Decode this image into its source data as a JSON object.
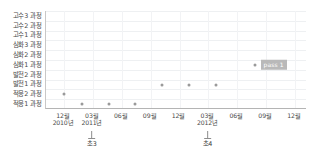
{
  "chart_data": {
    "type": "scatter",
    "title": "",
    "xlabel": "",
    "ylabel": "",
    "grid": true,
    "legend": "none",
    "y_categories": [
      "고수3 과정",
      "고수2 과정",
      "고수1 과정",
      "심화3 과정",
      "심화2 과정",
      "심화1 과정",
      "발전2 과정",
      "발전1 과정",
      "적응2 과정",
      "적응1 과정"
    ],
    "x_ticks": [
      {
        "month": "12월",
        "year": "2010년"
      },
      {
        "month": "03월",
        "year": "2011년"
      },
      {
        "month": "06월",
        "year": ""
      },
      {
        "month": "09월",
        "year": ""
      },
      {
        "month": "12월",
        "year": ""
      },
      {
        "month": "03월",
        "year": "2012년"
      },
      {
        "month": "06월",
        "year": ""
      },
      {
        "month": "09월",
        "year": ""
      },
      {
        "month": "12월",
        "year": ""
      }
    ],
    "annotations": [
      {
        "label": "초3",
        "x_index": 1
      },
      {
        "label": "초4",
        "x_index": 5
      }
    ],
    "points": [
      {
        "x_index": 0.0,
        "y_category": "적응2 과정",
        "label": ""
      },
      {
        "x_index": 0.62,
        "y_category": "적응1 과정",
        "label": ""
      },
      {
        "x_index": 1.55,
        "y_category": "적응1 과정",
        "label": ""
      },
      {
        "x_index": 2.45,
        "y_category": "적응1 과정",
        "label": ""
      },
      {
        "x_index": 3.38,
        "y_category": "발전1 과정",
        "label": ""
      },
      {
        "x_index": 4.32,
        "y_category": "발전1 과정",
        "label": ""
      },
      {
        "x_index": 5.25,
        "y_category": "발전1 과정",
        "label": ""
      },
      {
        "x_index": 6.6,
        "y_category": "심화1 과정",
        "label": "pass 1"
      }
    ],
    "colors": {
      "point": "#9a9a9a",
      "badge_background": "#b9b9b9",
      "badge_text": "#ffffff",
      "grid": "#eef0f2",
      "axis": "#b4b4b4",
      "text": "#4a4a4a"
    }
  }
}
